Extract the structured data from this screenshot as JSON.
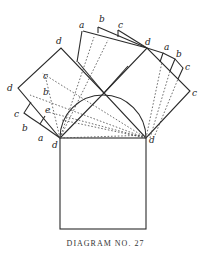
{
  "caption": "DIAGRAM NO. 27",
  "colors": {
    "ink": "#2a2a2a",
    "paper": "#ffffff"
  },
  "labels": {
    "left_square": {
      "top": "d",
      "left": "d",
      "inner_c": "c",
      "inner_b": "b",
      "inner_e": "e",
      "tab_c": "c",
      "tab_b": "b",
      "tab_a": "a"
    },
    "top": {
      "a": "a",
      "b": "b",
      "c": "c"
    },
    "right_square": {
      "top": "d",
      "tab_a": "a",
      "tab_b": "b",
      "tab_c": "c",
      "right": "c"
    },
    "base": {
      "left": "d",
      "right": "d"
    }
  }
}
